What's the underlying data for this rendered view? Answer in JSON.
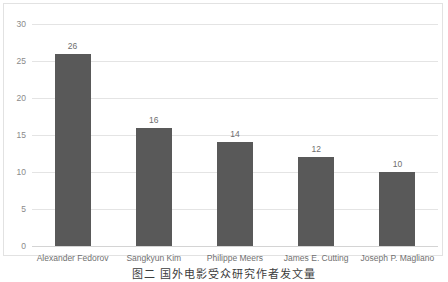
{
  "chart_data": {
    "type": "bar",
    "title": "",
    "xlabel": "",
    "ylabel": "",
    "categories": [
      "Alexander Fedorov",
      "Sangkyun Kim",
      "Philippe Meers",
      "James E. Cutting",
      "Joseph P. Magliano"
    ],
    "values": [
      26,
      16,
      14,
      12,
      10
    ],
    "ylim": [
      0,
      30
    ],
    "yticks": [
      0,
      5,
      10,
      15,
      20,
      25,
      30
    ],
    "ytick_labels": [
      "0",
      "5",
      "10",
      "15",
      "20",
      "25",
      "30"
    ],
    "grid": true,
    "legend": false,
    "bar_color": "#595959",
    "gridline_color": "#e4e4e4",
    "label_color": "#707070",
    "data_labels": [
      "26",
      "16",
      "14",
      "12",
      "10"
    ]
  },
  "caption": {
    "text": "图二 国外电影受众研究作者发文量",
    "note": "clipped at image bottom edge"
  }
}
